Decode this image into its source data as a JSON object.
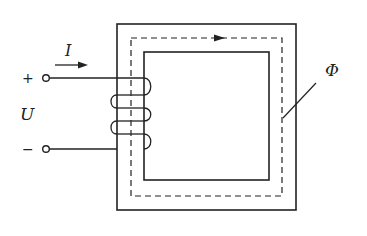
{
  "diagram": {
    "labels": {
      "current": "I",
      "voltage": "U",
      "flux": "Φ",
      "plus": "+",
      "minus": "−"
    },
    "colors": {
      "line": "#222222",
      "background": "#ffffff"
    }
  }
}
